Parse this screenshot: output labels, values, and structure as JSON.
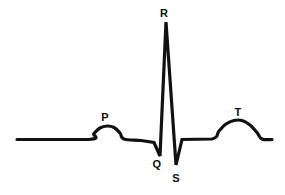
{
  "figure": {
    "background_color": "#ffffff",
    "stroke_color": "#111111",
    "width": 285,
    "height": 195
  },
  "labels": [
    {
      "name": "p-wave-label",
      "text": "P",
      "x": 105,
      "y": 117
    },
    {
      "name": "q-wave-label",
      "text": "Q",
      "x": 157,
      "y": 164
    },
    {
      "name": "r-wave-label",
      "text": "R",
      "x": 164,
      "y": 13
    },
    {
      "name": "s-wave-label",
      "text": "S",
      "x": 176,
      "y": 178
    },
    {
      "name": "t-wave-label",
      "text": "T",
      "x": 238,
      "y": 112
    }
  ],
  "chart_data": {
    "type": "line",
    "xlabel": "",
    "ylabel": "",
    "grid": false,
    "legend": "none",
    "baseline_y": 139.5,
    "xlim": [
      0,
      285
    ],
    "ylim": [
      195,
      0
    ],
    "annotations": [
      "P",
      "Q",
      "R",
      "S",
      "T"
    ],
    "series": [
      {
        "name": "ecg-trace",
        "points": [
          [
            17,
            139.5
          ],
          [
            88,
            139.5
          ],
          [
            94,
            133.5
          ],
          [
            100,
            128.0
          ],
          [
            107,
            126.0
          ],
          [
            114,
            127.5
          ],
          [
            120,
            133.0
          ],
          [
            124,
            139.0
          ],
          [
            141,
            140.5
          ],
          [
            154,
            142.5
          ],
          [
            160,
            156.0
          ],
          [
            166,
            22.0
          ],
          [
            176,
            165.0
          ],
          [
            182,
            139.5
          ],
          [
            212,
            139.0
          ],
          [
            219,
            131.0
          ],
          [
            226,
            124.0
          ],
          [
            234,
            120.5
          ],
          [
            242,
            120.5
          ],
          [
            250,
            125.0
          ],
          [
            257,
            132.5
          ],
          [
            262,
            139.0
          ],
          [
            272,
            139.5
          ]
        ]
      }
    ]
  }
}
